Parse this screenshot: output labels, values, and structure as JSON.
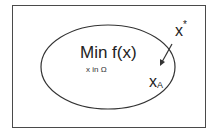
{
  "diagram": {
    "objective": "Min f(x)",
    "constraint": "x in Ω",
    "point_a": {
      "base": "x",
      "subscript": "A"
    },
    "point_star": {
      "base": "x",
      "superscript": "*"
    },
    "colors": {
      "stroke": "#333333",
      "background": "#ffffff"
    }
  }
}
